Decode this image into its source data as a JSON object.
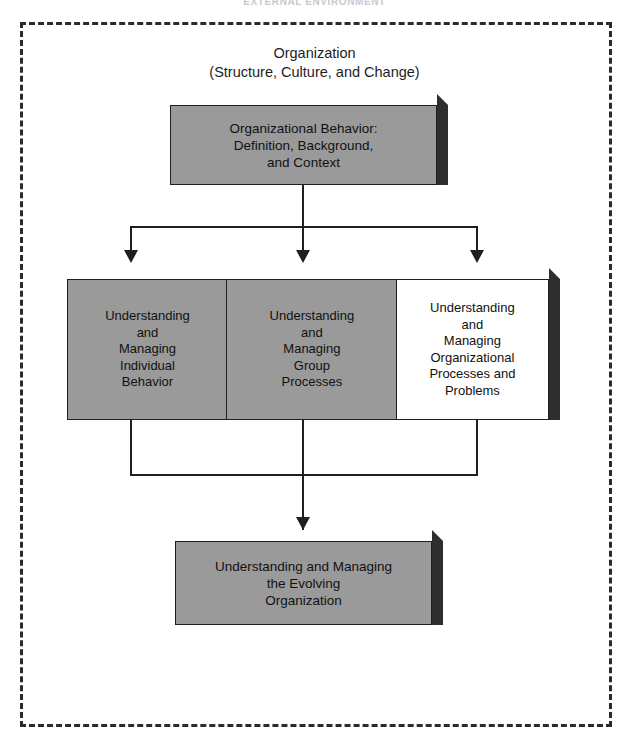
{
  "page": {
    "header_title": "EXTERNAL ENVIRONMENT",
    "background_color": "#ffffff"
  },
  "boundary": {
    "name": "external-environment-boundary",
    "style": "dashed",
    "color": "#2b2b2b"
  },
  "organization_caption": {
    "line1": "Organization",
    "line2": "(Structure, Culture, and Change)"
  },
  "colors": {
    "box_fill": "#9a9a9a",
    "box_fill_highlight": "#ffffff",
    "box_border": "#1f1f1f",
    "box_shadow": "#2e2e2e",
    "connector": "#1f1f1f"
  },
  "nodes": {
    "top": {
      "id": "organizational-behavior",
      "label": "Organizational Behavior:\nDefinition, Background,\nand Context",
      "fill": "gray"
    },
    "middle": [
      {
        "id": "individual-behavior",
        "label": "Understanding\nand\nManaging\nIndividual\nBehavior",
        "fill": "gray"
      },
      {
        "id": "group-processes",
        "label": "Understanding\nand\nManaging\nGroup\nProcesses",
        "fill": "gray"
      },
      {
        "id": "organizational-processes",
        "label": "Understanding\nand\nManaging\nOrganizational\nProcesses and\nProblems",
        "fill": "white"
      }
    ],
    "bottom": {
      "id": "evolving-organization",
      "label": "Understanding and Managing\nthe Evolving\nOrganization",
      "fill": "gray"
    }
  },
  "connectors": {
    "top_to_middle": "one-to-three-branching-arrows",
    "middle_to_bottom": "three-to-one-merging-arrow"
  }
}
